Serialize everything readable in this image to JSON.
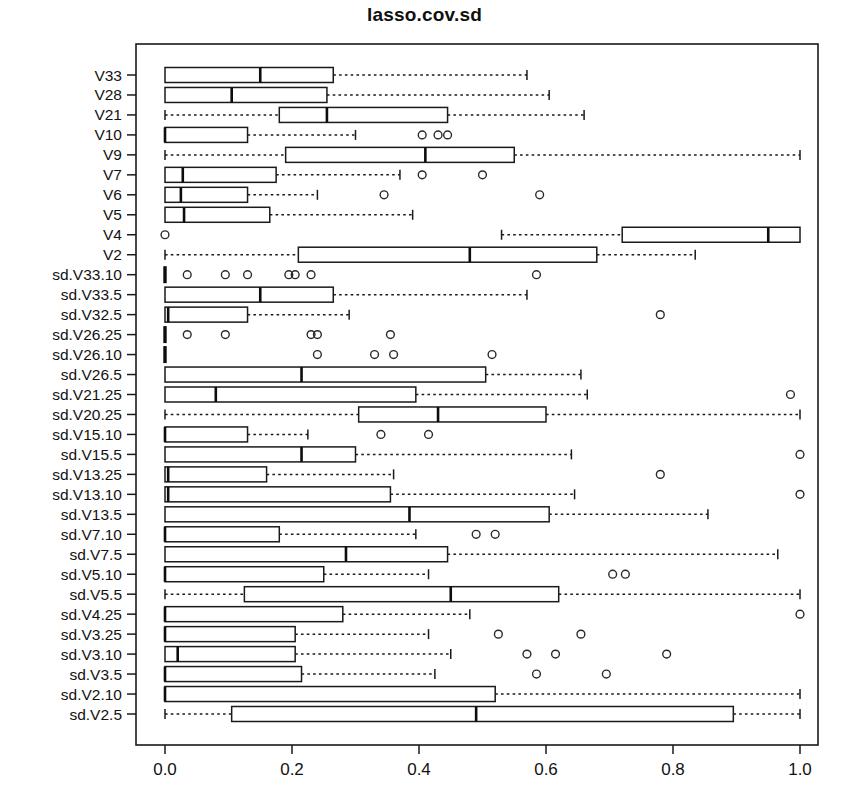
{
  "chart_data": {
    "type": "boxplot",
    "title": "lasso.cov.sd",
    "orientation": "horizontal",
    "xlabel": "",
    "ylabel": "",
    "xlim": [
      -0.03,
      1.03
    ],
    "xticks": [
      0.0,
      0.2,
      0.4,
      0.6,
      0.8,
      1.0
    ],
    "xticklabels": [
      "0.0",
      "0.2",
      "0.4",
      "0.6",
      "0.8",
      "1.0"
    ],
    "grid": false,
    "legend": null,
    "categories": [
      "V33",
      "V28",
      "V21",
      "V10",
      "V9",
      "V7",
      "V6",
      "V5",
      "V4",
      "V2",
      "sd.V33.10",
      "sd.V33.5",
      "sd.V32.5",
      "sd.V26.25",
      "sd.V26.10",
      "sd.V26.5",
      "sd.V21.25",
      "sd.V20.25",
      "sd.V15.10",
      "sd.V15.5",
      "sd.V13.25",
      "sd.V13.10",
      "sd.V13.5",
      "sd.V7.10",
      "sd.V7.5",
      "sd.V5.10",
      "sd.V5.5",
      "sd.V4.25",
      "sd.V3.25",
      "sd.V3.10",
      "sd.V3.5",
      "sd.V2.10",
      "sd.V2.5"
    ],
    "boxes": [
      {
        "label": "V33",
        "wlo": 0.0,
        "q1": 0.0,
        "med": 0.15,
        "q3": 0.265,
        "whi": 0.57,
        "outliers": []
      },
      {
        "label": "V28",
        "wlo": 0.0,
        "q1": 0.0,
        "med": 0.105,
        "q3": 0.255,
        "whi": 0.605,
        "outliers": []
      },
      {
        "label": "V21",
        "wlo": 0.0,
        "q1": 0.18,
        "med": 0.255,
        "q3": 0.445,
        "whi": 0.66,
        "outliers": []
      },
      {
        "label": "V10",
        "wlo": 0.0,
        "q1": 0.0,
        "med": 0.0,
        "q3": 0.13,
        "whi": 0.3,
        "outliers": [
          0.405,
          0.43,
          0.445
        ]
      },
      {
        "label": "V9",
        "wlo": 0.0,
        "q1": 0.19,
        "med": 0.41,
        "q3": 0.55,
        "whi": 1.0,
        "outliers": []
      },
      {
        "label": "V7",
        "wlo": 0.0,
        "q1": 0.0,
        "med": 0.028,
        "q3": 0.175,
        "whi": 0.37,
        "outliers": [
          0.405,
          0.5
        ]
      },
      {
        "label": "V6",
        "wlo": 0.0,
        "q1": 0.0,
        "med": 0.025,
        "q3": 0.13,
        "whi": 0.24,
        "outliers": [
          0.345,
          0.59
        ]
      },
      {
        "label": "V5",
        "wlo": 0.0,
        "q1": 0.0,
        "med": 0.03,
        "q3": 0.165,
        "whi": 0.39,
        "outliers": []
      },
      {
        "label": "V4",
        "wlo": 0.53,
        "q1": 0.72,
        "med": 0.95,
        "q3": 1.0,
        "whi": 1.0,
        "outliers": [
          0.0
        ]
      },
      {
        "label": "V2",
        "wlo": 0.0,
        "q1": 0.21,
        "med": 0.48,
        "q3": 0.68,
        "whi": 0.835,
        "outliers": []
      },
      {
        "label": "sd.V33.10",
        "wlo": 0.0,
        "q1": 0.0,
        "med": 0.0,
        "q3": 0.0,
        "whi": 0.0,
        "outliers": [
          0.035,
          0.095,
          0.13,
          0.195,
          0.205,
          0.23,
          0.585
        ]
      },
      {
        "label": "sd.V33.5",
        "wlo": 0.0,
        "q1": 0.0,
        "med": 0.15,
        "q3": 0.265,
        "whi": 0.57,
        "outliers": []
      },
      {
        "label": "sd.V32.5",
        "wlo": 0.0,
        "q1": 0.0,
        "med": 0.005,
        "q3": 0.13,
        "whi": 0.29,
        "outliers": [
          0.78
        ]
      },
      {
        "label": "sd.V26.25",
        "wlo": 0.0,
        "q1": 0.0,
        "med": 0.0,
        "q3": 0.0,
        "whi": 0.0,
        "outliers": [
          0.035,
          0.095,
          0.23,
          0.24,
          0.355
        ]
      },
      {
        "label": "sd.V26.10",
        "wlo": 0.0,
        "q1": 0.0,
        "med": 0.0,
        "q3": 0.0,
        "whi": 0.0,
        "outliers": [
          0.24,
          0.33,
          0.36,
          0.515
        ]
      },
      {
        "label": "sd.V26.5",
        "wlo": 0.0,
        "q1": 0.0,
        "med": 0.215,
        "q3": 0.505,
        "whi": 0.655,
        "outliers": []
      },
      {
        "label": "sd.V21.25",
        "wlo": 0.0,
        "q1": 0.0,
        "med": 0.08,
        "q3": 0.395,
        "whi": 0.665,
        "outliers": [
          0.985
        ]
      },
      {
        "label": "sd.V20.25",
        "wlo": 0.0,
        "q1": 0.305,
        "med": 0.43,
        "q3": 0.6,
        "whi": 1.0,
        "outliers": []
      },
      {
        "label": "sd.V15.10",
        "wlo": 0.0,
        "q1": 0.0,
        "med": 0.0,
        "q3": 0.13,
        "whi": 0.225,
        "outliers": [
          0.34,
          0.415
        ]
      },
      {
        "label": "sd.V15.5",
        "wlo": 0.0,
        "q1": 0.0,
        "med": 0.215,
        "q3": 0.3,
        "whi": 0.64,
        "outliers": [
          1.0
        ]
      },
      {
        "label": "sd.V13.25",
        "wlo": 0.0,
        "q1": 0.0,
        "med": 0.005,
        "q3": 0.16,
        "whi": 0.36,
        "outliers": [
          0.78
        ]
      },
      {
        "label": "sd.V13.10",
        "wlo": 0.0,
        "q1": 0.0,
        "med": 0.005,
        "q3": 0.355,
        "whi": 0.645,
        "outliers": [
          1.0
        ]
      },
      {
        "label": "sd.V13.5",
        "wlo": 0.0,
        "q1": 0.0,
        "med": 0.385,
        "q3": 0.605,
        "whi": 0.855,
        "outliers": []
      },
      {
        "label": "sd.V7.10",
        "wlo": 0.0,
        "q1": 0.0,
        "med": 0.0,
        "q3": 0.18,
        "whi": 0.395,
        "outliers": [
          0.49,
          0.52
        ]
      },
      {
        "label": "sd.V7.5",
        "wlo": 0.0,
        "q1": 0.0,
        "med": 0.285,
        "q3": 0.445,
        "whi": 0.965,
        "outliers": []
      },
      {
        "label": "sd.V5.10",
        "wlo": 0.0,
        "q1": 0.0,
        "med": 0.0,
        "q3": 0.25,
        "whi": 0.415,
        "outliers": [
          0.705,
          0.725
        ]
      },
      {
        "label": "sd.V5.5",
        "wlo": 0.0,
        "q1": 0.125,
        "med": 0.45,
        "q3": 0.62,
        "whi": 1.0,
        "outliers": []
      },
      {
        "label": "sd.V4.25",
        "wlo": 0.0,
        "q1": 0.0,
        "med": 0.0,
        "q3": 0.28,
        "whi": 0.48,
        "outliers": [
          1.0
        ]
      },
      {
        "label": "sd.V3.25",
        "wlo": 0.0,
        "q1": 0.0,
        "med": 0.0,
        "q3": 0.205,
        "whi": 0.415,
        "outliers": [
          0.525,
          0.655
        ]
      },
      {
        "label": "sd.V3.10",
        "wlo": 0.0,
        "q1": 0.0,
        "med": 0.02,
        "q3": 0.205,
        "whi": 0.45,
        "outliers": [
          0.57,
          0.615,
          0.79
        ]
      },
      {
        "label": "sd.V3.5",
        "wlo": 0.0,
        "q1": 0.0,
        "med": 0.0,
        "q3": 0.215,
        "whi": 0.425,
        "outliers": [
          0.585,
          0.695
        ]
      },
      {
        "label": "sd.V2.10",
        "wlo": 0.0,
        "q1": 0.0,
        "med": 0.0,
        "q3": 0.52,
        "whi": 1.0,
        "outliers": []
      },
      {
        "label": "sd.V2.5",
        "wlo": 0.0,
        "q1": 0.105,
        "med": 0.49,
        "q3": 0.895,
        "whi": 1.0,
        "outliers": []
      }
    ],
    "colors": {
      "box_fill": "#ffffff",
      "box_stroke": "#1a1a1a",
      "median": "#0d0d0d",
      "whisker": "#1a1a1a",
      "outlier": "#2a2a2a",
      "background": "#ffffff",
      "text": "#121212"
    }
  }
}
